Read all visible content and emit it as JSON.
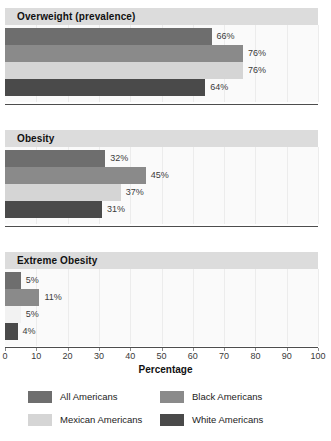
{
  "chart_data": {
    "type": "bar",
    "orientation": "horizontal",
    "title": "",
    "xlabel": "Percentage",
    "ylabel": "",
    "xlim": [
      0,
      100
    ],
    "xticks": [
      0,
      10,
      20,
      30,
      40,
      50,
      60,
      70,
      80,
      90,
      100
    ],
    "grid": true,
    "legend_position": "bottom",
    "series": [
      {
        "name": "All Americans",
        "color": "#6e6e6e",
        "values": [
          66,
          32,
          5
        ]
      },
      {
        "name": "Black Americans",
        "color": "#8a8a8a",
        "values": [
          76,
          45,
          11
        ]
      },
      {
        "name": "Mexican Americans",
        "color": "#d5d5d5",
        "values": [
          76,
          37,
          5
        ]
      },
      {
        "name": "White Americans",
        "color": "#4a4a4a",
        "values": [
          64,
          31,
          4
        ]
      }
    ],
    "panels": [
      {
        "title": "Overweight (prevalence)",
        "bars": [
          {
            "series": "All Americans",
            "value": 66,
            "label": "66%",
            "color": "#6e6e6e"
          },
          {
            "series": "Black Americans",
            "value": 76,
            "label": "76%",
            "color": "#8a8a8a"
          },
          {
            "series": "Mexican Americans",
            "value": 76,
            "label": "76%",
            "color": "#d5d5d5"
          },
          {
            "series": "White Americans",
            "value": 64,
            "label": "64%",
            "color": "#4a4a4a"
          }
        ]
      },
      {
        "title": "Obesity",
        "bars": [
          {
            "series": "All Americans",
            "value": 32,
            "label": "32%",
            "color": "#6e6e6e"
          },
          {
            "series": "Black Americans",
            "value": 45,
            "label": "45%",
            "color": "#8a8a8a"
          },
          {
            "series": "Mexican Americans",
            "value": 37,
            "label": "37%",
            "color": "#d5d5d5"
          },
          {
            "series": "White Americans",
            "value": 31,
            "label": "31%",
            "color": "#4a4a4a"
          }
        ]
      },
      {
        "title": "Extreme Obesity",
        "bars": [
          {
            "series": "All Americans",
            "value": 5,
            "label": "5%",
            "color": "#6e6e6e"
          },
          {
            "series": "Black Americans",
            "value": 11,
            "label": "11%",
            "color": "#8a8a8a"
          },
          {
            "series": "Mexican Americans",
            "value": 5,
            "label": "5%",
            "color": "#f2f2f2"
          },
          {
            "series": "White Americans",
            "value": 4,
            "label": "4%",
            "color": "#4a4a4a"
          }
        ]
      }
    ],
    "legend": [
      {
        "label": "All Americans",
        "color": "#6e6e6e"
      },
      {
        "label": "Black Americans",
        "color": "#8a8a8a"
      },
      {
        "label": "Mexican Americans",
        "color": "#d5d5d5"
      },
      {
        "label": "White Americans",
        "color": "#4a4a4a"
      }
    ]
  }
}
